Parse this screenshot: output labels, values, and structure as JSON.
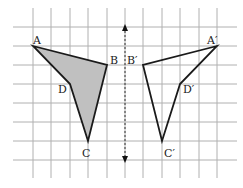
{
  "diagram": {
    "type": "reflection",
    "grid": {
      "x_lines": [
        33,
        51,
        70,
        88,
        107,
        125,
        143,
        162,
        180,
        199,
        217
      ],
      "y_lines": [
        27,
        46,
        65,
        84,
        103,
        122,
        141,
        160
      ],
      "x_extent": [
        13,
        237
      ],
      "y_extent": [
        8,
        178
      ],
      "color": "#b0b0b0"
    },
    "mirror_line": {
      "x": 125,
      "y_top": 27,
      "y_bottom": 160,
      "style": "dashed",
      "arrows": "both"
    },
    "original": {
      "fill": "#c0c0c0",
      "stroke": "#1a1a1a",
      "points": {
        "A": [
          33,
          46
        ],
        "B": [
          107,
          65
        ],
        "C": [
          88,
          141
        ],
        "D": [
          70,
          84
        ]
      },
      "labels": {
        "A": {
          "text": "A",
          "x": 33,
          "y": 44
        },
        "B": {
          "text": "B",
          "x": 110,
          "y": 64
        },
        "C": {
          "text": "C",
          "x": 82,
          "y": 157
        },
        "D": {
          "text": "D",
          "x": 58,
          "y": 93
        }
      }
    },
    "image": {
      "fill": "none",
      "stroke": "#1a1a1a",
      "points": {
        "A'": [
          217,
          46
        ],
        "B'": [
          143,
          65
        ],
        "C'": [
          162,
          141
        ],
        "D'": [
          180,
          84
        ]
      },
      "labels": {
        "A'": {
          "text": "A′",
          "x": 207,
          "y": 44
        },
        "B'": {
          "text": "B′",
          "x": 127,
          "y": 64
        },
        "C'": {
          "text": "C′",
          "x": 164,
          "y": 157
        },
        "D'": {
          "text": "D′",
          "x": 183,
          "y": 93
        }
      }
    }
  }
}
